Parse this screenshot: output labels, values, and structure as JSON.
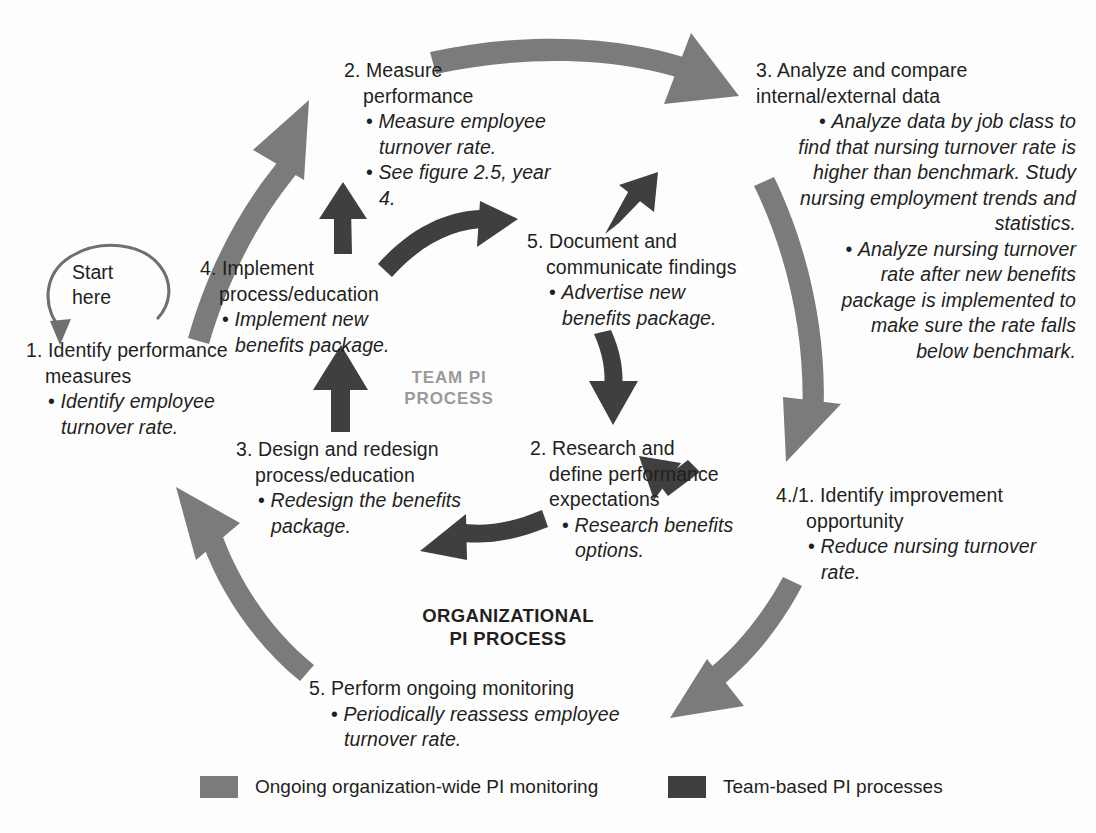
{
  "figure": {
    "title_partial": "",
    "colors": {
      "org_arrow": "#7b7b7b",
      "team_arrow": "#3f3f3f",
      "start_arrow": "#6f6f6f",
      "text": "#231f20",
      "team_label": "#9a9a9a",
      "background": "#ffffff"
    }
  },
  "start": {
    "line1": "Start",
    "line2": "here",
    "icon": "curved-start-arrow"
  },
  "center_labels": {
    "team": {
      "line1": "TEAM PI",
      "line2": "PROCESS"
    },
    "org": {
      "line1": "ORGANIZATIONAL",
      "line2": "PI PROCESS"
    }
  },
  "org_steps": [
    {
      "id": "org-1",
      "heading": "1. Identify performance",
      "heading2": "measures",
      "bullets": [
        "Identify employee turnover rate."
      ]
    },
    {
      "id": "org-2",
      "heading": "2. Measure",
      "heading2": "performance",
      "bullets": [
        "Measure employee turnover rate.",
        "See figure 2.5, year 4."
      ]
    },
    {
      "id": "org-3",
      "heading": "3. Analyze and compare",
      "heading2": "internal/external data",
      "bullets": [
        "Analyze data by job class to find that nursing turnover rate is higher than benchmark. Study nursing employment trends and statistics.",
        "Analyze nursing turnover rate after new benefits package is implemented to make sure the rate falls below benchmark."
      ]
    },
    {
      "id": "org-4",
      "heading": "4./1. Identify improvement",
      "heading2": "opportunity",
      "bullets": [
        "Reduce nursing turnover rate."
      ]
    },
    {
      "id": "org-5",
      "heading": "5. Perform ongoing monitoring",
      "heading2": "",
      "bullets": [
        "Periodically reassess employee turnover rate."
      ]
    }
  ],
  "team_steps": [
    {
      "id": "team-2",
      "heading": "2. Research and",
      "heading2": "define performance",
      "heading3": "expectations",
      "bullets": [
        "Research benefits options."
      ]
    },
    {
      "id": "team-3",
      "heading": "3. Design and redesign",
      "heading2": "process/education",
      "bullets": [
        "Redesign the benefits package."
      ]
    },
    {
      "id": "team-4",
      "heading": "4. Implement",
      "heading2": "process/education",
      "bullets": [
        "Implement new benefits package."
      ]
    },
    {
      "id": "team-5",
      "heading": "5. Document and",
      "heading2": "communicate findings",
      "bullets": [
        "Advertise new benefits package."
      ]
    }
  ],
  "legend": {
    "items": [
      {
        "label": "Ongoing organization-wide PI monitoring",
        "color": "#7b7b7b"
      },
      {
        "label": "Team-based PI processes",
        "color": "#3f3f3f"
      }
    ]
  }
}
